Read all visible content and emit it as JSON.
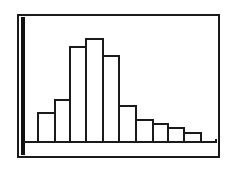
{
  "chart_data": {
    "type": "bar",
    "subtype": "histogram",
    "title": "",
    "xlabel": "",
    "ylabel": "",
    "categories": [
      "1",
      "2",
      "3",
      "4",
      "5",
      "6",
      "7",
      "8",
      "9",
      "10"
    ],
    "values": [
      30,
      43,
      96,
      104,
      87,
      37,
      23,
      19,
      15,
      10
    ],
    "ylim": [
      0,
      125
    ],
    "grid": false,
    "legend": null,
    "colors": {
      "bar_fill": "#ffffff",
      "bar_stroke": "#1a1a1a",
      "axis": "#111111"
    }
  },
  "layout": {
    "baseline_y": 142,
    "bars_px": [
      {
        "x": 37,
        "w": 17
      },
      {
        "x": 54,
        "w": 15
      },
      {
        "x": 69,
        "w": 16
      },
      {
        "x": 85,
        "w": 17
      },
      {
        "x": 102,
        "w": 16
      },
      {
        "x": 118,
        "w": 17
      },
      {
        "x": 135,
        "w": 17
      },
      {
        "x": 152,
        "w": 15
      },
      {
        "x": 167,
        "w": 16
      },
      {
        "x": 183,
        "w": 17
      }
    ]
  }
}
